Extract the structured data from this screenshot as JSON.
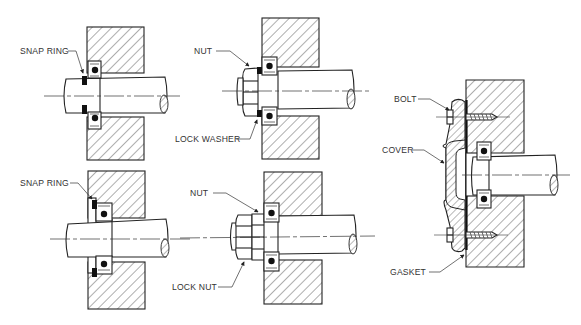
{
  "diagram": {
    "type": "technical-illustration",
    "panels": [
      {
        "id": "top-left",
        "method": "snap ring",
        "labels": [
          {
            "text": "SNAP RING",
            "target": "snap-ring"
          }
        ]
      },
      {
        "id": "top-middle",
        "method": "nut and lock washer",
        "labels": [
          {
            "text": "NUT",
            "target": "nut"
          },
          {
            "text": "LOCK WASHER",
            "target": "lock-washer"
          }
        ]
      },
      {
        "id": "bottom-left",
        "method": "snap ring in housing",
        "labels": [
          {
            "text": "SNAP RING",
            "target": "snap-ring"
          }
        ]
      },
      {
        "id": "bottom-middle",
        "method": "nut and lock nut",
        "labels": [
          {
            "text": "NUT",
            "target": "nut"
          },
          {
            "text": "LOCK NUT",
            "target": "lock-nut"
          }
        ]
      },
      {
        "id": "right",
        "method": "bolted cover with gasket",
        "labels": [
          {
            "text": "BOLT",
            "target": "bolt"
          },
          {
            "text": "COVER",
            "target": "cover"
          },
          {
            "text": "GASKET",
            "target": "gasket"
          }
        ]
      }
    ]
  },
  "labels": {
    "snap_ring_top": "SNAP RING",
    "nut_top": "NUT",
    "lock_washer": "LOCK WASHER",
    "snap_ring_bottom": "SNAP RING",
    "nut_bottom": "NUT",
    "lock_nut": "LOCK NUT",
    "bolt": "BOLT",
    "cover": "COVER",
    "gasket": "GASKET"
  }
}
